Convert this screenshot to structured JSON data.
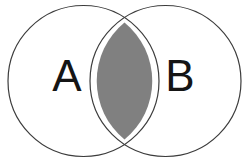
{
  "figure": {
    "kind": "venn-diagram",
    "title": "",
    "width": 249,
    "height": 160,
    "background_color": "#FFFFFF"
  },
  "style": {
    "circle_stroke_color": "#3C3C3C",
    "circle_stroke_width": 1.2,
    "circle_fill_color": "#FFFFFF",
    "intersection_fill_color": "#808080",
    "label_color": "#151515",
    "label_font_size": 44
  },
  "sets": [
    {
      "id": "set-a",
      "label": "A",
      "center_x": 83.5,
      "center_y": 81,
      "radius": 75.5,
      "label_x": 67,
      "label_y": 79,
      "fill": "#FFFFFF"
    },
    {
      "id": "set-b",
      "label": "B",
      "center_x": 165.5,
      "center_y": 81,
      "radius": 75.5,
      "label_x": 180,
      "label_y": 79,
      "fill": "#FFFFFF"
    }
  ],
  "intersection": {
    "id": "set-a-intersect-b",
    "label": "",
    "fill": "#808080",
    "shaded": true,
    "top_point_x": 124.5,
    "top_point_y": 22.5,
    "bottom_point_x": 124.5,
    "bottom_point_y": 139.5,
    "left_extent_x": 90,
    "right_extent_x": 159
  }
}
